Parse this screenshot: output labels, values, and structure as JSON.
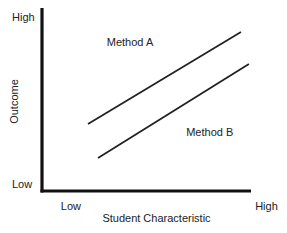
{
  "chart_data": {
    "type": "line",
    "title": "",
    "xlabel": "Student Characteristic",
    "ylabel": "Outcome",
    "xlim": [
      0,
      10
    ],
    "ylim": [
      0,
      10
    ],
    "x_tick_labels": [
      {
        "value": 0.9,
        "label": "Low"
      },
      {
        "value": 10.2,
        "label": "High"
      }
    ],
    "y_tick_labels": [
      {
        "value": 0.4,
        "label": "Low"
      },
      {
        "value": 9.5,
        "label": "High"
      }
    ],
    "grid": false,
    "legend": "none",
    "series": [
      {
        "name": "Method A",
        "x": [
          2.2,
          9.52
        ],
        "y": [
          3.66,
          8.69
        ],
        "label_at": {
          "x": 3.1,
          "y": 7.9
        }
      },
      {
        "name": "Method B",
        "x": [
          2.68,
          9.9
        ],
        "y": [
          1.8,
          6.94
        ],
        "label_at": {
          "x": 6.9,
          "y": 3.0
        }
      }
    ],
    "colors": {
      "axis": "#111111",
      "line": "#222222",
      "text": "#222222"
    }
  }
}
